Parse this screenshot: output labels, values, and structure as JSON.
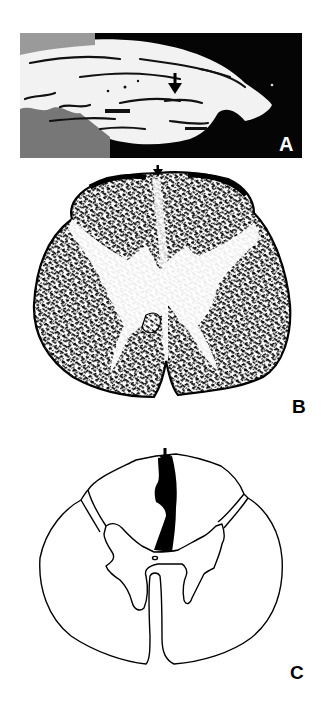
{
  "figure": {
    "panels": [
      {
        "id": "A",
        "label": "A",
        "kind": "photograph",
        "description": "Sagittal grayscale image with white tissue on dark background; arrow points to lesion",
        "label_color": "#ffffff",
        "background_color": "#050505"
      },
      {
        "id": "B",
        "label": "B",
        "kind": "histology-section",
        "description": "Stained transverse section of spinal cord with arrow at dorsal midline",
        "label_color": "#000000"
      },
      {
        "id": "C",
        "label": "C",
        "kind": "line-drawing",
        "description": "Schematic spinal cord cross-section with black wedge lesion in the dorsal column beneath arrow",
        "label_color": "#000000",
        "lesion_color": "#000000"
      }
    ],
    "arrows": [
      {
        "panel": "A",
        "direction": "down"
      },
      {
        "panel": "B",
        "direction": "down"
      },
      {
        "panel": "C",
        "direction": "down"
      }
    ]
  }
}
